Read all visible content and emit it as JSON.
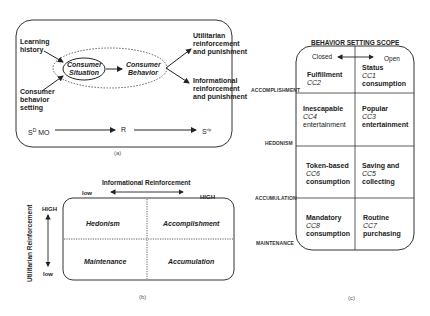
{
  "panel_a": {
    "caption": "(a)",
    "inputs": {
      "learning_history": "Learning history",
      "behavior_setting": [
        "Consumer",
        "behavior",
        "setting"
      ]
    },
    "consumer_situation": [
      "Consumer",
      "Situation"
    ],
    "consumer_behavior": [
      "Consumer",
      "Behavior"
    ],
    "outputs": {
      "utilitarian": [
        "Utilitarian",
        "reinforcement",
        "and punishment"
      ],
      "informational": [
        "Informational",
        "reinforcement",
        "and punishment"
      ]
    },
    "sequence": {
      "sd_mo_base": "S",
      "sd_mo_sup": "D",
      "sd_mo_tail": " MO",
      "r": "R",
      "srp_base": "S",
      "srp_sup": "r/p"
    }
  },
  "panel_b": {
    "caption": "(b)",
    "x_axis": {
      "title": "Informational Reinforcement",
      "low": "low",
      "high": "HIGH"
    },
    "y_axis": {
      "title": "Utilitarian Reinforcement",
      "high": "HIGH",
      "low": "low"
    },
    "quadrants": {
      "top_left": "Hedonism",
      "top_right": "Accomplishment",
      "bottom_left": "Maintenance",
      "bottom_right": "Accumulation"
    }
  },
  "panel_c": {
    "caption": "(c)",
    "title": "BEHAVIOR SETTING SCOPE",
    "closed": "Closed",
    "open": "Open",
    "rows": [
      {
        "label": "ACCOMPLISHMENT",
        "closed": {
          "top": "Fulfillment",
          "code": "CC2",
          "bottom": ""
        },
        "open": {
          "top": "Status",
          "code": "CC1",
          "bottom": "consumption"
        }
      },
      {
        "label": "HEDONISM",
        "closed": {
          "top": "Inescapable",
          "code": "CC4",
          "bottom": "entertainment"
        },
        "open": {
          "top": "Popular",
          "code": "CC3",
          "bottom": "entertainment"
        }
      },
      {
        "label": "ACCUMULATION",
        "closed": {
          "top": "Token-based",
          "code": "CC6",
          "bottom": "consumption"
        },
        "open": {
          "top": "Saving and",
          "code": "CC5",
          "bottom": "collecting"
        }
      },
      {
        "label": "MAINTENANCE",
        "closed": {
          "top": "Mandatory",
          "code": "CC8",
          "bottom": "consumption"
        },
        "open": {
          "top": "Routine",
          "code": "CC7",
          "bottom": "purchasing"
        }
      }
    ]
  }
}
